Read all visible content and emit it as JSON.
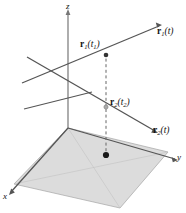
{
  "figure": {
    "caption": "Two space curves r1(t) and r2(t) with position vectors at times t1 and t2 projected onto the xy-plane",
    "background_color": "#ffffff",
    "line_color": "#555555",
    "plane_fill": "#d8d8d8",
    "plane_stroke": "#9a9a9a",
    "dash_color": "#666666",
    "point_color": "#222222",
    "axes": [
      {
        "name": "z",
        "label": "z"
      },
      {
        "name": "y",
        "label": "y"
      },
      {
        "name": "x",
        "label": "x"
      }
    ],
    "labels": {
      "r1_t": {
        "bold": "r",
        "sub": "1",
        "arg": "(t)"
      },
      "r1_t1": {
        "bold": "r",
        "sub": "1",
        "arg_open": "(",
        "arg_var": "t",
        "arg_sub": "1",
        "arg_close": ")"
      },
      "r2_t2": {
        "bold": "r",
        "sub": "2",
        "arg_open": "(",
        "arg_var": "t",
        "arg_sub": "2",
        "arg_close": ")"
      },
      "r2_t": {
        "bold": "r",
        "sub": "2",
        "arg": "(t)"
      }
    },
    "points": [
      {
        "name": "point-r1-t1",
        "x": 106,
        "y": 55,
        "filled": true
      },
      {
        "name": "point-r2-t2",
        "x": 106,
        "y": 107,
        "filled": false
      },
      {
        "name": "point-projection",
        "x": 106,
        "y": 155,
        "filled": true
      }
    ]
  }
}
